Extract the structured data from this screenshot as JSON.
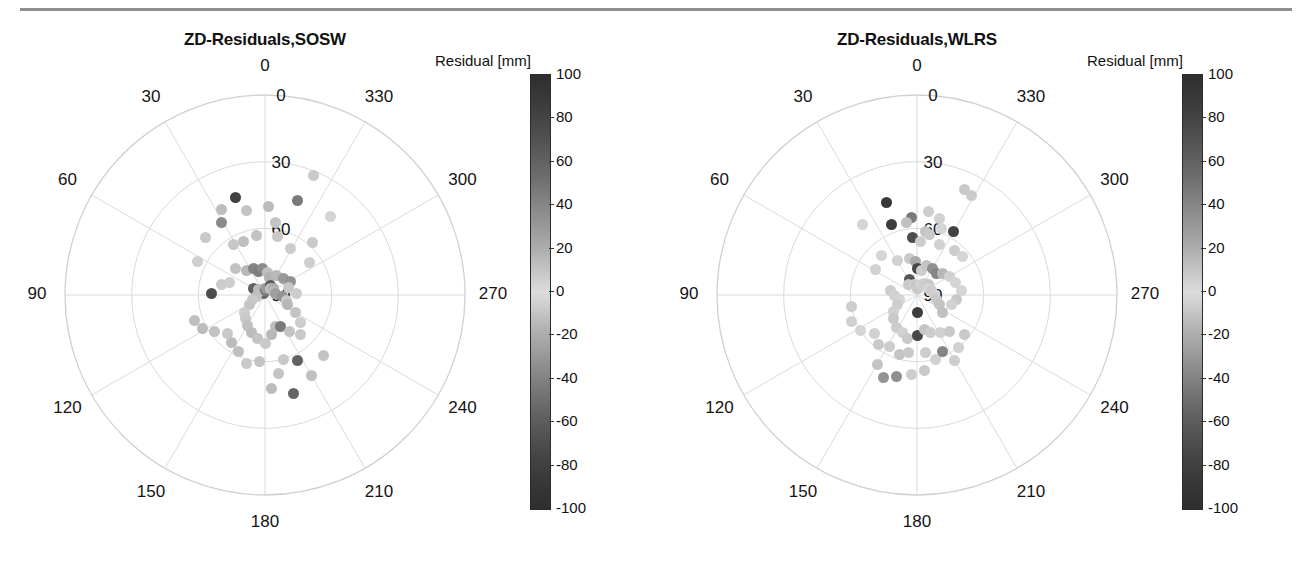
{
  "figure": {
    "background": "#ffffff",
    "rule_color": "#8d8f92"
  },
  "chart_data": [
    {
      "type": "scatter",
      "projection": "polar",
      "title": "ZD-Residuals,SOSW",
      "xlabel": "",
      "ylabel": "",
      "azimuth_ticks": [
        "0",
        "30",
        "60",
        "90",
        "120",
        "150",
        "180",
        "210",
        "240",
        "270",
        "300",
        "330"
      ],
      "radial_ticks": [
        "0",
        "30",
        "60",
        "90"
      ],
      "radial_range": [
        90,
        0
      ],
      "grid": true,
      "colorbar": {
        "label": "Residual [mm]",
        "ticks": [
          "100",
          "80",
          "60",
          "40",
          "20",
          "0",
          "-20",
          "-40",
          "-60",
          "-80",
          "-100"
        ],
        "vmin": -100,
        "vmax": 100,
        "cmap": "grayscale-diverging"
      },
      "points": [
        {
          "az": 338,
          "zd": 32,
          "v": 22
        },
        {
          "az": 17,
          "zd": 44,
          "v": 88
        },
        {
          "az": 341,
          "zd": 45,
          "v": 60
        },
        {
          "az": 320,
          "zd": 44,
          "v": 16
        },
        {
          "az": 27,
          "zd": 47,
          "v": 27
        },
        {
          "az": 12,
          "zd": 51,
          "v": 24
        },
        {
          "az": 358,
          "zd": 50,
          "v": 28
        },
        {
          "az": 31,
          "zd": 52,
          "v": 52
        },
        {
          "az": 46,
          "zd": 53,
          "v": 22
        },
        {
          "az": 352,
          "zd": 57,
          "v": 24
        },
        {
          "az": 318,
          "zd": 58,
          "v": 22
        },
        {
          "az": 64,
          "zd": 56,
          "v": 19
        },
        {
          "az": 32,
          "zd": 63,
          "v": 23
        },
        {
          "az": 22,
          "zd": 64,
          "v": 26
        },
        {
          "az": 8,
          "zd": 63,
          "v": 25
        },
        {
          "az": 348,
          "zd": 63,
          "v": 22
        },
        {
          "az": 331,
          "zd": 66,
          "v": 20
        },
        {
          "az": 306,
          "zd": 65,
          "v": 19
        },
        {
          "az": 88,
          "zd": 66,
          "v": 82
        },
        {
          "az": 76,
          "zd": 70,
          "v": 21
        },
        {
          "az": 70,
          "zd": 73,
          "v": 20
        },
        {
          "az": 48,
          "zd": 72,
          "v": 25
        },
        {
          "az": 37,
          "zd": 76,
          "v": 30
        },
        {
          "az": 24,
          "zd": 77,
          "v": 55
        },
        {
          "az": 16,
          "zd": 79,
          "v": 58
        },
        {
          "az": 6,
          "zd": 78,
          "v": 52
        },
        {
          "az": 354,
          "zd": 80,
          "v": 26
        },
        {
          "az": 344,
          "zd": 82,
          "v": 33
        },
        {
          "az": 330,
          "zd": 80,
          "v": 30
        },
        {
          "az": 312,
          "zd": 79,
          "v": 45
        },
        {
          "az": 298,
          "zd": 77,
          "v": 48
        },
        {
          "az": 289,
          "zd": 79,
          "v": 23
        },
        {
          "az": 272,
          "zd": 76,
          "v": 20
        },
        {
          "az": 60,
          "zd": 84,
          "v": 72
        },
        {
          "az": 50,
          "zd": 86,
          "v": 28
        },
        {
          "az": 42,
          "zd": 88,
          "v": 24
        },
        {
          "az": 30,
          "zd": 89,
          "v": 70
        },
        {
          "az": 18,
          "zd": 88,
          "v": 30
        },
        {
          "az": 6,
          "zd": 87,
          "v": 34
        },
        {
          "az": 355,
          "zd": 88,
          "v": 62
        },
        {
          "az": 344,
          "zd": 87,
          "v": 44
        },
        {
          "az": 332,
          "zd": 85,
          "v": 75
        },
        {
          "az": 320,
          "zd": 86,
          "v": 26
        },
        {
          "az": 306,
          "zd": 85,
          "v": 36
        },
        {
          "az": 292,
          "zd": 86,
          "v": 30
        },
        {
          "az": 280,
          "zd": 85,
          "v": 42
        },
        {
          "az": 266,
          "zd": 82,
          "v": 48
        },
        {
          "az": 256,
          "zd": 80,
          "v": 22
        },
        {
          "az": 246,
          "zd": 79,
          "v": 30
        },
        {
          "az": 240,
          "zd": 74,
          "v": 24
        },
        {
          "az": 232,
          "zd": 70,
          "v": 20
        },
        {
          "az": 100,
          "zd": 86,
          "v": 26
        },
        {
          "az": 112,
          "zd": 84,
          "v": 22
        },
        {
          "az": 122,
          "zd": 82,
          "v": 24
        },
        {
          "az": 130,
          "zd": 78,
          "v": 20
        },
        {
          "az": 140,
          "zd": 76,
          "v": 22
        },
        {
          "az": 150,
          "zd": 74,
          "v": 26
        },
        {
          "az": 160,
          "zd": 72,
          "v": 28
        },
        {
          "az": 170,
          "zd": 70,
          "v": 24
        },
        {
          "az": 180,
          "zd": 68,
          "v": 22
        },
        {
          "az": 190,
          "zd": 72,
          "v": 30
        },
        {
          "az": 198,
          "zd": 75,
          "v": 28
        },
        {
          "az": 206,
          "zd": 74,
          "v": 60
        },
        {
          "az": 214,
          "zd": 70,
          "v": 24
        },
        {
          "az": 222,
          "zd": 66,
          "v": 22
        },
        {
          "az": 175,
          "zd": 60,
          "v": 24
        },
        {
          "az": 165,
          "zd": 58,
          "v": 22
        },
        {
          "az": 155,
          "zd": 62,
          "v": 26
        },
        {
          "az": 145,
          "zd": 64,
          "v": 28
        },
        {
          "az": 136,
          "zd": 66,
          "v": 22
        },
        {
          "az": 126,
          "zd": 62,
          "v": 25
        },
        {
          "az": 118,
          "zd": 58,
          "v": 28
        },
        {
          "az": 110,
          "zd": 56,
          "v": 26
        },
        {
          "az": 196,
          "zd": 60,
          "v": 22
        },
        {
          "az": 206,
          "zd": 57,
          "v": 72
        },
        {
          "az": 190,
          "zd": 54,
          "v": 24
        },
        {
          "az": 184,
          "zd": 48,
          "v": 28
        },
        {
          "az": 196,
          "zd": 44,
          "v": 70
        },
        {
          "az": 210,
          "zd": 48,
          "v": 26
        },
        {
          "az": 224,
          "zd": 52,
          "v": 24
        }
      ]
    },
    {
      "type": "scatter",
      "projection": "polar",
      "title": "ZD-Residuals,WLRS",
      "xlabel": "",
      "ylabel": "",
      "azimuth_ticks": [
        "0",
        "30",
        "60",
        "90",
        "120",
        "150",
        "180",
        "210",
        "240",
        "270",
        "300",
        "330"
      ],
      "radial_ticks": [
        "0",
        "30",
        "60",
        "90"
      ],
      "radial_range": [
        90,
        0
      ],
      "grid": true,
      "colorbar": {
        "label": "Residual [mm]",
        "ticks": [
          "100",
          "80",
          "60",
          "40",
          "20",
          "0",
          "-20",
          "-40",
          "-60",
          "-80",
          "-100"
        ],
        "vmin": -100,
        "vmax": 100,
        "cmap": "grayscale-diverging"
      },
      "points": [
        {
          "az": 336,
          "zd": 38,
          "v": 22
        },
        {
          "az": 331,
          "zd": 39,
          "v": 21
        },
        {
          "az": 18,
          "zd": 46,
          "v": 92
        },
        {
          "az": 38,
          "zd": 50,
          "v": 14
        },
        {
          "az": 352,
          "zd": 52,
          "v": 20
        },
        {
          "az": 344,
          "zd": 54,
          "v": 18
        },
        {
          "az": 20,
          "zd": 56,
          "v": 90
        },
        {
          "az": 4,
          "zd": 55,
          "v": 60
        },
        {
          "az": 8,
          "zd": 57,
          "v": 26
        },
        {
          "az": 330,
          "zd": 57,
          "v": 88
        },
        {
          "az": 340,
          "zd": 58,
          "v": 16
        },
        {
          "az": 352,
          "zd": 61,
          "v": 24
        },
        {
          "az": 348,
          "zd": 62,
          "v": 22
        },
        {
          "az": 4,
          "zd": 64,
          "v": 82
        },
        {
          "az": 356,
          "zd": 66,
          "v": 20
        },
        {
          "az": 336,
          "zd": 65,
          "v": 18
        },
        {
          "az": 320,
          "zd": 64,
          "v": 20
        },
        {
          "az": 310,
          "zd": 63,
          "v": 16
        },
        {
          "az": 42,
          "zd": 66,
          "v": 14
        },
        {
          "az": 58,
          "zd": 68,
          "v": 12
        },
        {
          "az": 30,
          "zd": 72,
          "v": 18
        },
        {
          "az": 12,
          "zd": 73,
          "v": 22
        },
        {
          "az": 2,
          "zd": 75,
          "v": 38
        },
        {
          "az": 358,
          "zd": 78,
          "v": 85
        },
        {
          "az": 350,
          "zd": 79,
          "v": 20
        },
        {
          "az": 342,
          "zd": 76,
          "v": 24
        },
        {
          "az": 330,
          "zd": 76,
          "v": 50
        },
        {
          "az": 318,
          "zd": 77,
          "v": 55
        },
        {
          "az": 310,
          "zd": 75,
          "v": 30
        },
        {
          "az": 300,
          "zd": 73,
          "v": 18
        },
        {
          "az": 288,
          "zd": 72,
          "v": 16
        },
        {
          "az": 276,
          "zd": 70,
          "v": 14
        },
        {
          "az": 264,
          "zd": 72,
          "v": 22
        },
        {
          "az": 254,
          "zd": 74,
          "v": 18
        },
        {
          "az": 26,
          "zd": 82,
          "v": 78
        },
        {
          "az": 40,
          "zd": 84,
          "v": 22
        },
        {
          "az": 14,
          "zd": 85,
          "v": 20
        },
        {
          "az": 4,
          "zd": 86,
          "v": 24
        },
        {
          "az": 352,
          "zd": 87,
          "v": 22
        },
        {
          "az": 340,
          "zd": 85,
          "v": 18
        },
        {
          "az": 328,
          "zd": 84,
          "v": 20
        },
        {
          "az": 314,
          "zd": 83,
          "v": 22
        },
        {
          "az": 300,
          "zd": 84,
          "v": 16
        },
        {
          "az": 286,
          "zd": 83,
          "v": 20
        },
        {
          "az": 272,
          "zd": 82,
          "v": 18
        },
        {
          "az": 258,
          "zd": 81,
          "v": 22
        },
        {
          "az": 246,
          "zd": 79,
          "v": 24
        },
        {
          "az": 236,
          "zd": 76,
          "v": 26
        },
        {
          "az": 80,
          "zd": 78,
          "v": 20
        },
        {
          "az": 92,
          "zd": 80,
          "v": 18
        },
        {
          "az": 104,
          "zd": 82,
          "v": 16
        },
        {
          "az": 116,
          "zd": 80,
          "v": 20
        },
        {
          "az": 126,
          "zd": 77,
          "v": 18
        },
        {
          "az": 136,
          "zd": 75,
          "v": 22
        },
        {
          "az": 148,
          "zd": 73,
          "v": 20
        },
        {
          "az": 158,
          "zd": 72,
          "v": 18
        },
        {
          "az": 168,
          "zd": 70,
          "v": 22
        },
        {
          "az": 180,
          "zd": 72,
          "v": 85
        },
        {
          "az": 180,
          "zd": 82,
          "v": 90
        },
        {
          "az": 192,
          "zd": 74,
          "v": 24
        },
        {
          "az": 200,
          "zd": 72,
          "v": 20
        },
        {
          "az": 212,
          "zd": 70,
          "v": 18
        },
        {
          "az": 222,
          "zd": 68,
          "v": 22
        },
        {
          "az": 152,
          "zd": 64,
          "v": 20
        },
        {
          "az": 142,
          "zd": 62,
          "v": 22
        },
        {
          "az": 132,
          "zd": 64,
          "v": 18
        },
        {
          "az": 122,
          "zd": 60,
          "v": 16
        },
        {
          "az": 112,
          "zd": 58,
          "v": 18
        },
        {
          "az": 100,
          "zd": 60,
          "v": 20
        },
        {
          "az": 164,
          "zd": 62,
          "v": 24
        },
        {
          "az": 172,
          "zd": 64,
          "v": 22
        },
        {
          "az": 188,
          "zd": 64,
          "v": 20
        },
        {
          "az": 196,
          "zd": 60,
          "v": 18
        },
        {
          "az": 204,
          "zd": 62,
          "v": 55
        },
        {
          "az": 186,
          "zd": 56,
          "v": 22
        },
        {
          "az": 176,
          "zd": 54,
          "v": 20
        },
        {
          "az": 166,
          "zd": 52,
          "v": 50
        },
        {
          "az": 158,
          "zd": 50,
          "v": 48
        },
        {
          "az": 150,
          "zd": 54,
          "v": 24
        },
        {
          "az": 210,
          "zd": 56,
          "v": 20
        },
        {
          "az": 218,
          "zd": 60,
          "v": 18
        },
        {
          "az": 230,
          "zd": 62,
          "v": 22
        }
      ]
    }
  ]
}
